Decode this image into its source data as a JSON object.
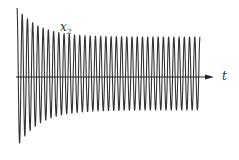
{
  "diagram": {
    "y_label": "x",
    "y_label_subscript": "2",
    "x_label": "t",
    "colors": {
      "line": "#333333",
      "axis": "#222222",
      "background": "#ffffff"
    }
  },
  "chart_data": {
    "type": "line",
    "title": "",
    "xlabel": "t",
    "ylabel": "x2",
    "axis": {
      "origin_x": 16,
      "axis_y": 77,
      "axis_end_x": 214,
      "arrow": true
    },
    "wave": {
      "start_x": 17,
      "end_x": 200,
      "cycles": 35,
      "upper_envelope": {
        "start_amplitude": 69,
        "steady_amplitude": 40
      },
      "lower_envelope": {
        "start_amplitude": 70,
        "steady_amplitude": 33
      },
      "decay_rate": 0.045
    },
    "grid": false,
    "legend": null
  }
}
